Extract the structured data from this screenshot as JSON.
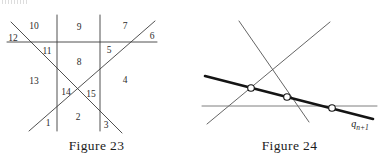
{
  "page": {
    "width": 386,
    "height": 160,
    "background": "#ffffff",
    "ink_color": "#3d3d3d",
    "thick_ink_color": "#1a1a1a",
    "text_color": "#1c1c1c"
  },
  "figures": [
    {
      "id": "figure-23",
      "caption": "Figure 23",
      "description": "Arrangement of six lines partitioning the plane into numbered regions",
      "lines": [
        {
          "name": "horizontal-line",
          "x1": 7,
          "y1": 42,
          "x2": 157,
          "y2": 42
        },
        {
          "name": "vertical-line-left",
          "x1": 57,
          "y1": 15,
          "x2": 57,
          "y2": 131
        },
        {
          "name": "vertical-line-right",
          "x1": 100,
          "y1": 15,
          "x2": 100,
          "y2": 131
        },
        {
          "name": "diagonal-down-right",
          "x1": 11,
          "y1": 22,
          "x2": 122,
          "y2": 133
        },
        {
          "name": "diagonal-up-right",
          "x1": 29,
          "y1": 131,
          "x2": 155,
          "y2": 21
        }
      ],
      "region_labels": [
        {
          "name": "region-1",
          "text": "1",
          "x": 48,
          "y": 124
        },
        {
          "name": "region-2",
          "text": "2",
          "x": 78,
          "y": 118
        },
        {
          "name": "region-3",
          "text": "3",
          "x": 106,
          "y": 126
        },
        {
          "name": "region-4",
          "text": "4",
          "x": 125,
          "y": 81
        },
        {
          "name": "region-5",
          "text": "5",
          "x": 109,
          "y": 51
        },
        {
          "name": "region-6",
          "text": "6",
          "x": 152,
          "y": 37
        },
        {
          "name": "region-7",
          "text": "7",
          "x": 125,
          "y": 27
        },
        {
          "name": "region-8",
          "text": "8",
          "x": 79,
          "y": 63
        },
        {
          "name": "region-9",
          "text": "9",
          "x": 79,
          "y": 28
        },
        {
          "name": "region-10",
          "text": "10",
          "x": 34,
          "y": 27
        },
        {
          "name": "region-11",
          "text": "11",
          "x": 47,
          "y": 52
        },
        {
          "name": "region-12",
          "text": "12",
          "x": 13,
          "y": 39
        },
        {
          "name": "region-13",
          "text": "13",
          "x": 34,
          "y": 82
        },
        {
          "name": "region-14",
          "text": "14",
          "x": 66,
          "y": 93
        },
        {
          "name": "region-15",
          "text": "15",
          "x": 91,
          "y": 95
        }
      ]
    },
    {
      "id": "figure-24",
      "caption": "Figure 24",
      "description": "Three thin lines crossed by one thick line with three marked intersection points",
      "lines": [
        {
          "name": "thin-line-down-right",
          "x1": 46,
          "y1": 21,
          "x2": 116,
          "y2": 122,
          "style": "thin"
        },
        {
          "name": "thin-line-up-right",
          "x1": 14,
          "y1": 124,
          "x2": 137,
          "y2": 22,
          "style": "thin"
        },
        {
          "name": "horizontal-line",
          "x1": 9,
          "y1": 106,
          "x2": 184,
          "y2": 106,
          "style": "thin"
        },
        {
          "name": "thick-line-qn1",
          "x1": 12,
          "y1": 76,
          "x2": 180,
          "y2": 119,
          "style": "thick"
        }
      ],
      "points": [
        {
          "name": "intersection-point-1",
          "x": 58,
          "y": 88
        },
        {
          "name": "intersection-point-2",
          "x": 94,
          "y": 97
        },
        {
          "name": "intersection-point-3",
          "x": 139,
          "y": 108
        }
      ],
      "line_label": {
        "name": "q-n-plus-1-label",
        "base": "q",
        "subscript": "n+1",
        "x": 167,
        "y": 125
      }
    }
  ]
}
